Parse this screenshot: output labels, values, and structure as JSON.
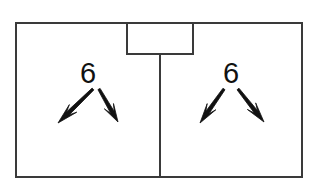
{
  "canvas": {
    "width": 313,
    "height": 190,
    "background": "#ffffff"
  },
  "style": {
    "stroke_color": "#3a3a3a",
    "stroke_width": 2,
    "arrow_color": "#111111",
    "label_color": "#111111",
    "label_font_size": 29
  },
  "diagram": {
    "outer_rectangle": {
      "name": "outer-boundary",
      "x": 16,
      "y": 23,
      "width": 286,
      "height": 154
    },
    "notch_rectangle": {
      "name": "top-center-notch",
      "x": 127,
      "y": 23,
      "width": 66,
      "height": 31
    },
    "divider": {
      "name": "center-vertical-divider",
      "x": 160,
      "y_start": 53,
      "y_end": 177
    },
    "groups": [
      {
        "name": "left-bay",
        "label": "6",
        "label_x": 88,
        "label_y": 83,
        "arrows": [
          {
            "name": "arrow-down-left",
            "x1": 93,
            "y1": 89,
            "x2": 58,
            "y2": 123
          },
          {
            "name": "arrow-down-right",
            "x1": 99,
            "y1": 89,
            "x2": 118,
            "y2": 122
          }
        ]
      },
      {
        "name": "right-bay",
        "label": "6",
        "label_x": 231,
        "label_y": 83,
        "arrows": [
          {
            "name": "arrow-down-left",
            "x1": 224,
            "y1": 89,
            "x2": 200,
            "y2": 123
          },
          {
            "name": "arrow-down-right",
            "x1": 238,
            "y1": 89,
            "x2": 264,
            "y2": 122
          }
        ]
      }
    ]
  }
}
